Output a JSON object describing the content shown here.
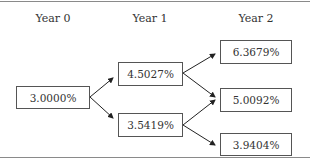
{
  "headers": [
    "Year 0",
    "Year 1",
    "Year 2"
  ],
  "nodes": {
    "y0": "3.0000%",
    "y1_up": "4.5027%",
    "y1_down": "3.5419%",
    "y2_up": "6.3679%",
    "y2_mid": "5.0092%",
    "y2_down": "3.9404%"
  }
}
